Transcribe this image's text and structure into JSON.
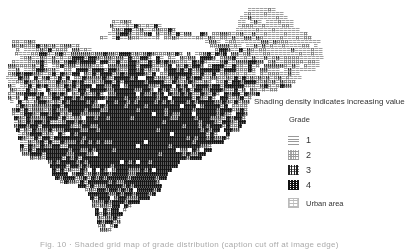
{
  "map": {
    "description": "Choropleth grid map with shaded cells by grade",
    "cell_size": 4,
    "grades": {
      "1": "#c8c8c8",
      "2": "#a0a0a0",
      "3": "#555555",
      "4": "#1a1a1a"
    },
    "outline_rows": [
      {
        "y": 20,
        "x0": 112,
        "x1": 130
      },
      {
        "y": 24,
        "x0": 110,
        "x1": 160
      },
      {
        "y": 28,
        "x0": 112,
        "x1": 175
      },
      {
        "y": 32,
        "x0": 108,
        "x1": 190
      },
      {
        "y": 36,
        "x0": 100,
        "x1": 200
      },
      {
        "y": 40,
        "x0": 12,
        "x1": 35
      },
      {
        "y": 44,
        "x0": 12,
        "x1": 80
      },
      {
        "y": 48,
        "x0": 12,
        "x1": 90
      },
      {
        "y": 52,
        "x0": 15,
        "x1": 320
      },
      {
        "y": 56,
        "x0": 20,
        "x1": 322
      },
      {
        "y": 60,
        "x0": 12,
        "x1": 320
      },
      {
        "y": 64,
        "x0": 8,
        "x1": 318
      },
      {
        "y": 68,
        "x0": 8,
        "x1": 315
      },
      {
        "y": 72,
        "x0": 8,
        "x1": 300
      },
      {
        "y": 76,
        "x0": 6,
        "x1": 300
      },
      {
        "y": 80,
        "x0": 8,
        "x1": 295
      },
      {
        "y": 84,
        "x0": 8,
        "x1": 290
      },
      {
        "y": 88,
        "x0": 10,
        "x1": 275
      },
      {
        "y": 92,
        "x0": 8,
        "x1": 260
      },
      {
        "y": 96,
        "x0": 8,
        "x1": 250
      },
      {
        "y": 100,
        "x0": 10,
        "x1": 250
      },
      {
        "y": 104,
        "x0": 12,
        "x1": 248
      },
      {
        "y": 108,
        "x0": 12,
        "x1": 245
      },
      {
        "y": 112,
        "x0": 12,
        "x1": 245
      },
      {
        "y": 116,
        "x0": 14,
        "x1": 245
      },
      {
        "y": 120,
        "x0": 14,
        "x1": 245
      },
      {
        "y": 124,
        "x0": 14,
        "x1": 242
      },
      {
        "y": 128,
        "x0": 16,
        "x1": 240
      },
      {
        "y": 132,
        "x0": 18,
        "x1": 230
      },
      {
        "y": 136,
        "x0": 18,
        "x1": 228
      },
      {
        "y": 140,
        "x0": 20,
        "x1": 222
      },
      {
        "y": 144,
        "x0": 20,
        "x1": 215
      },
      {
        "y": 148,
        "x0": 20,
        "x1": 210
      },
      {
        "y": 152,
        "x0": 22,
        "x1": 205
      },
      {
        "y": 156,
        "x0": 30,
        "x1": 200
      },
      {
        "y": 160,
        "x0": 48,
        "x1": 178
      },
      {
        "y": 164,
        "x0": 50,
        "x1": 175
      },
      {
        "y": 168,
        "x0": 52,
        "x1": 170
      },
      {
        "y": 172,
        "x0": 52,
        "x1": 165
      },
      {
        "y": 176,
        "x0": 55,
        "x1": 165
      },
      {
        "y": 180,
        "x0": 60,
        "x1": 160
      },
      {
        "y": 184,
        "x0": 78,
        "x1": 160
      },
      {
        "y": 188,
        "x0": 85,
        "x1": 158
      },
      {
        "y": 192,
        "x0": 88,
        "x1": 155
      },
      {
        "y": 196,
        "x0": 90,
        "x1": 150
      },
      {
        "y": 200,
        "x0": 92,
        "x1": 140
      },
      {
        "y": 204,
        "x0": 92,
        "x1": 130
      },
      {
        "y": 208,
        "x0": 95,
        "x1": 125
      },
      {
        "y": 212,
        "x0": 95,
        "x1": 122
      },
      {
        "y": 216,
        "x0": 97,
        "x1": 120
      },
      {
        "y": 220,
        "x0": 97,
        "x1": 118
      },
      {
        "y": 224,
        "x0": 98,
        "x1": 115
      },
      {
        "y": 228,
        "x0": 100,
        "x1": 112
      }
    ],
    "upper_right_lobe_rows": [
      {
        "y": 8,
        "x0": 248,
        "x1": 275
      },
      {
        "y": 12,
        "x0": 244,
        "x1": 282
      },
      {
        "y": 16,
        "x0": 240,
        "x1": 288
      },
      {
        "y": 20,
        "x0": 238,
        "x1": 292
      },
      {
        "y": 24,
        "x0": 238,
        "x1": 296
      },
      {
        "y": 28,
        "x0": 236,
        "x1": 300
      },
      {
        "y": 32,
        "x0": 200,
        "x1": 306
      },
      {
        "y": 36,
        "x0": 200,
        "x1": 312
      },
      {
        "y": 40,
        "x0": 205,
        "x1": 318
      },
      {
        "y": 44,
        "x0": 210,
        "x1": 318
      },
      {
        "y": 48,
        "x0": 215,
        "x1": 320
      }
    ]
  },
  "legend": {
    "title": "Shading density indicates increasing value",
    "grade_heading": "Grade",
    "items": [
      {
        "label": "1",
        "grade": "g1",
        "top": 135
      },
      {
        "label": "2",
        "grade": "g2",
        "top": 150
      },
      {
        "label": "3",
        "grade": "g3",
        "top": 165
      },
      {
        "label": "4",
        "grade": "g4",
        "top": 180
      },
      {
        "label": "Urban area",
        "grade": "gu",
        "top": 198
      }
    ]
  },
  "caption": {
    "text": "Fig. 10 · Shaded grid map of grade distribution (caption cut off at image edge)"
  }
}
